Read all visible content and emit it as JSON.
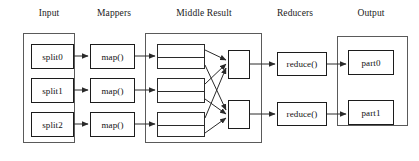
{
  "diagram": {
    "stage_labels": [
      {
        "id": "input",
        "text": "Input",
        "x": 24,
        "y": 8,
        "w": 50
      },
      {
        "id": "mappers",
        "text": "Mappers",
        "x": 86,
        "y": 8,
        "w": 56
      },
      {
        "id": "middle-result",
        "text": "Middle Result",
        "x": 156,
        "y": 8,
        "w": 96
      },
      {
        "id": "reducers",
        "text": "Reducers",
        "x": 264,
        "y": 8,
        "w": 62
      },
      {
        "id": "output",
        "text": "Output",
        "x": 344,
        "y": 8,
        "w": 54
      }
    ],
    "containers": [
      {
        "id": "input-container",
        "x": 23,
        "y": 33,
        "w": 52,
        "h": 110
      },
      {
        "id": "middle-container",
        "x": 145,
        "y": 33,
        "w": 117,
        "h": 110
      },
      {
        "id": "output-container",
        "x": 337,
        "y": 36,
        "w": 71,
        "h": 90
      }
    ],
    "splits": [
      {
        "id": "split0",
        "label": "split0",
        "x": 31,
        "y": 44,
        "w": 43,
        "h": 25
      },
      {
        "id": "split1",
        "label": "split1",
        "x": 31,
        "y": 78,
        "w": 43,
        "h": 25
      },
      {
        "id": "split2",
        "label": "split2",
        "x": 31,
        "y": 112,
        "w": 43,
        "h": 25
      }
    ],
    "mappers": [
      {
        "id": "map0",
        "label": "map()",
        "x": 90,
        "y": 44,
        "w": 45,
        "h": 25
      },
      {
        "id": "map1",
        "label": "map()",
        "x": 90,
        "y": 78,
        "w": 45,
        "h": 25
      },
      {
        "id": "map2",
        "label": "map()",
        "x": 90,
        "y": 112,
        "w": 45,
        "h": 25
      }
    ],
    "intermediate_partitions": [
      {
        "id": "partition-set-0",
        "x": 157,
        "y": 44,
        "w": 48,
        "h": 25,
        "rows": 2
      },
      {
        "id": "partition-set-1",
        "x": 157,
        "y": 78,
        "w": 48,
        "h": 25,
        "rows": 2
      },
      {
        "id": "partition-set-2",
        "x": 157,
        "y": 112,
        "w": 48,
        "h": 25,
        "rows": 2
      }
    ],
    "reducer_inputs": [
      {
        "id": "reducer-input-0",
        "x": 228,
        "y": 50,
        "w": 22,
        "h": 29
      },
      {
        "id": "reducer-input-1",
        "x": 228,
        "y": 100,
        "w": 22,
        "h": 29
      }
    ],
    "reducers": [
      {
        "id": "reduce0",
        "label": "reduce()",
        "x": 277,
        "y": 52,
        "w": 50,
        "h": 24
      },
      {
        "id": "reduce1",
        "label": "reduce()",
        "x": 277,
        "y": 102,
        "w": 50,
        "h": 24
      }
    ],
    "outputs": [
      {
        "id": "part0",
        "label": "part0",
        "x": 348,
        "y": 50,
        "w": 46,
        "h": 25
      },
      {
        "id": "part1",
        "label": "part1",
        "x": 348,
        "y": 100,
        "w": 46,
        "h": 25
      }
    ],
    "flow_arrows": [
      {
        "id": "split0-to-map0",
        "x1": 74,
        "y1": 56,
        "x2": 88,
        "y2": 56
      },
      {
        "id": "split1-to-map1",
        "x1": 74,
        "y1": 90,
        "x2": 88,
        "y2": 90
      },
      {
        "id": "split2-to-map2",
        "x1": 74,
        "y1": 124,
        "x2": 88,
        "y2": 124
      },
      {
        "id": "map0-to-partition0",
        "x1": 135,
        "y1": 56,
        "x2": 155,
        "y2": 56
      },
      {
        "id": "map1-to-partition1",
        "x1": 135,
        "y1": 90,
        "x2": 155,
        "y2": 90
      },
      {
        "id": "map2-to-partition2",
        "x1": 135,
        "y1": 124,
        "x2": 155,
        "y2": 124
      },
      {
        "id": "reducerinput0-to-reduce0",
        "x1": 250,
        "y1": 64,
        "x2": 275,
        "y2": 64
      },
      {
        "id": "reducerinput1-to-reduce1",
        "x1": 250,
        "y1": 114,
        "x2": 275,
        "y2": 114
      },
      {
        "id": "reduce0-to-part0",
        "x1": 327,
        "y1": 64,
        "x2": 346,
        "y2": 64
      },
      {
        "id": "reduce1-to-part1",
        "x1": 327,
        "y1": 114,
        "x2": 346,
        "y2": 114
      }
    ],
    "shuffle_arrows": [
      {
        "id": "shuffle-p0a-to-r0",
        "x1": 205,
        "y1": 50,
        "x2": 226,
        "y2": 60
      },
      {
        "id": "shuffle-p0b-to-r1",
        "x1": 205,
        "y1": 65,
        "x2": 226,
        "y2": 110
      },
      {
        "id": "shuffle-p1a-to-r0",
        "x1": 205,
        "y1": 84,
        "x2": 226,
        "y2": 64
      },
      {
        "id": "shuffle-p1b-to-r1",
        "x1": 205,
        "y1": 99,
        "x2": 226,
        "y2": 114
      },
      {
        "id": "shuffle-p2a-to-r0",
        "x1": 205,
        "y1": 118,
        "x2": 226,
        "y2": 68
      },
      {
        "id": "shuffle-p2b-to-r1",
        "x1": 205,
        "y1": 133,
        "x2": 226,
        "y2": 118
      }
    ],
    "colors": {
      "background": "#ffffff",
      "node_border": "#1c1c1c",
      "container_border": "#5a5a5a",
      "arrow": "#2a2a2a",
      "text": "#111111"
    }
  }
}
